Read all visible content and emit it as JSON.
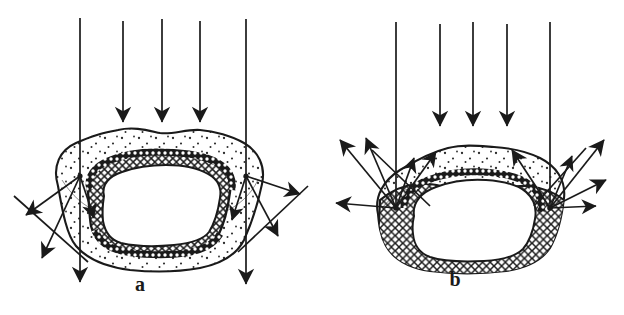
{
  "figure": {
    "background_color": "#ffffff",
    "ink_color": "#1a1a1a",
    "width": 624,
    "height": 315,
    "type": "scientific-line-diagram"
  },
  "panels": [
    {
      "id": "a",
      "label": "a",
      "label_x": 140,
      "label_y": 290,
      "incoming_ray_count": 5,
      "scatter_node_count": 2,
      "scatter_direction": "downward-outward",
      "body": {
        "outer_layer_fill": "stipple",
        "inner_ring_fill": "cross-hatch",
        "core_fill": "white"
      }
    },
    {
      "id": "b",
      "label": "b",
      "label_x": 455,
      "label_y": 285,
      "incoming_ray_count": 5,
      "scatter_node_count": 2,
      "scatter_direction": "upward-outward",
      "body": {
        "outer_layer_fill": "stipple",
        "inner_ring_fill": "cross-hatch",
        "core_fill": "white"
      }
    }
  ],
  "colors": {
    "ink": "#1a1a1a",
    "background": "#ffffff",
    "stipple": "#2b2b2b",
    "hatch": "#1a1a1a"
  }
}
